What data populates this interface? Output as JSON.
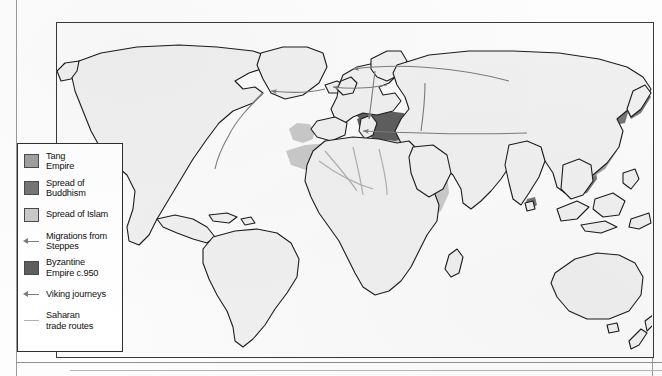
{
  "map": {
    "title": "",
    "projection": "world",
    "frame": {
      "x": 56,
      "y": 22,
      "width": 598,
      "height": 336
    },
    "colors": {
      "land_fill": "#f0f0f0",
      "land_outline": "#1c1c1c",
      "ocean": "#fbfbfb",
      "tang_empire": "#9f9f9f",
      "spread_of_buddhism": "#767676",
      "spread_of_islam": "#c9c9c9",
      "byzantine_empire": "#5e5e5e",
      "migration_arrow": "#7b7b7b",
      "viking_arrow": "#7b7b7b",
      "saharan_route": "#b0b0b0",
      "legend_border": "#2f2f2f",
      "frame_border": "#3a3a3a"
    }
  },
  "legend": {
    "items": [
      {
        "id": "tang-empire",
        "label": "Tang\nEmpire",
        "key_type": "swatch",
        "color": "#9f9f9f"
      },
      {
        "id": "spread-of-buddhism",
        "label": "Spread of\nBuddhism",
        "key_type": "swatch",
        "color": "#767676"
      },
      {
        "id": "spread-of-islam",
        "label": "Spread of Islam",
        "key_type": "swatch",
        "color": "#c9c9c9"
      },
      {
        "id": "migrations-from-steppes",
        "label": "Migrations from\nSteppes",
        "key_type": "arrow",
        "color": "#7b7b7b"
      },
      {
        "id": "byzantine-empire",
        "label": "Byzantine\nEmpire c.950",
        "key_type": "swatch",
        "color": "#5e5e5e"
      },
      {
        "id": "viking-journeys",
        "label": "Viking journeys",
        "key_type": "arrow",
        "color": "#7b7b7b"
      },
      {
        "id": "saharan-trade-routes",
        "label": "Saharan\ntrade routes",
        "key_type": "line",
        "color": "#b0b0b0"
      }
    ]
  },
  "regions": {
    "tang_empire": "eastern China",
    "spread_of_buddhism": "Tibet, Korea, Japan, Southeast Asia, Mongolia",
    "spread_of_islam": "Arabia, North Africa, Iberia, Persia, Central Asia",
    "byzantine_empire": "Anatolia, Balkans"
  }
}
